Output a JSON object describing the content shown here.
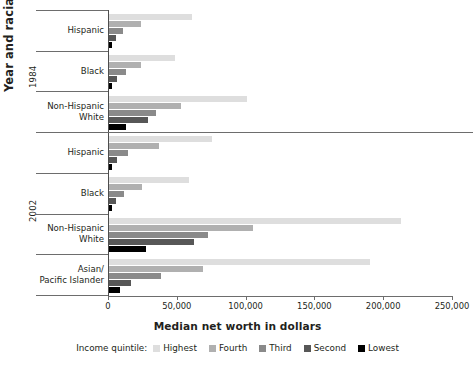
{
  "chart_data": {
    "type": "bar",
    "orientation": "horizontal",
    "title": "",
    "xlabel": "Median net worth in dollars",
    "ylabel": "Year and racial group",
    "xlim": [
      0,
      250000
    ],
    "xticks": [
      0,
      50000,
      100000,
      150000,
      200000,
      250000
    ],
    "xtick_labels": [
      "0",
      "50,000",
      "100,000",
      "150,000",
      "200,000",
      "250,000"
    ],
    "grid": false,
    "legend_title": "Income quintile:",
    "legend_position": "bottom",
    "series": [
      {
        "name": "Highest",
        "color": "#dedede",
        "values": [
          60000,
          48000,
          100000,
          75000,
          58000,
          212000,
          190000
        ]
      },
      {
        "name": "Fourth",
        "color": "#b0b0b0",
        "values": [
          23000,
          23000,
          52000,
          36000,
          24000,
          105000,
          68000
        ]
      },
      {
        "name": "Third",
        "color": "#8a8a8a",
        "values": [
          10000,
          12000,
          34000,
          14000,
          11000,
          72000,
          38000
        ]
      },
      {
        "name": "Second",
        "color": "#575757",
        "values": [
          5000,
          6000,
          28000,
          6000,
          5000,
          62000,
          16000
        ]
      },
      {
        "name": "Lowest",
        "color": "#000000",
        "values": [
          2000,
          2000,
          12000,
          2000,
          2000,
          27000,
          8000
        ]
      }
    ],
    "groups": [
      {
        "year": "1984",
        "categories": [
          "Hispanic",
          "Black",
          "Non-Hispanic\nWhite"
        ]
      },
      {
        "year": "2002",
        "categories": [
          "Hispanic",
          "Black",
          "Non-Hispanic\nWhite",
          "Asian/\nPacific Islander"
        ]
      }
    ],
    "categories": [
      "Hispanic",
      "Black",
      "Non-Hispanic\nWhite",
      "Hispanic",
      "Black",
      "Non-Hispanic\nWhite",
      "Asian/\nPacific Islander"
    ]
  },
  "axis": {
    "y_title": "Year and racial group",
    "x_title": "Median net worth in dollars"
  },
  "years": {
    "first": "1984",
    "second": "2002"
  },
  "legend": {
    "title": "Income quintile:",
    "items": [
      {
        "label": "Highest",
        "color": "#dedede"
      },
      {
        "label": "Fourth",
        "color": "#b0b0b0"
      },
      {
        "label": "Third",
        "color": "#8a8a8a"
      },
      {
        "label": "Second",
        "color": "#575757"
      },
      {
        "label": "Lowest",
        "color": "#000000"
      }
    ]
  },
  "ticks": [
    {
      "label": "0",
      "value": 0
    },
    {
      "label": "50,000",
      "value": 50000
    },
    {
      "label": "100,000",
      "value": 100000
    },
    {
      "label": "150,000",
      "value": 150000
    },
    {
      "label": "200,000",
      "value": 200000
    },
    {
      "label": "250,000",
      "value": 250000
    }
  ]
}
